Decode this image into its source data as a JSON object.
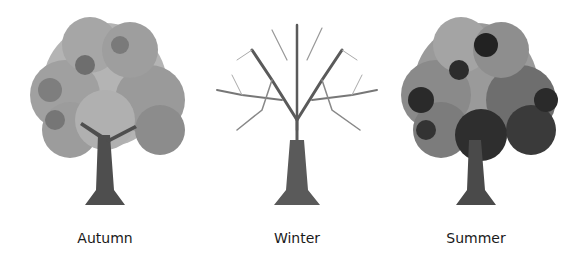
{
  "trees": [
    {
      "season": "Autumn",
      "type": "leafy-light",
      "center_x": 105
    },
    {
      "season": "Winter",
      "type": "bare",
      "center_x": 297
    },
    {
      "season": "Summer",
      "type": "leafy-dark",
      "center_x": 476
    }
  ],
  "colors": {
    "background": "#ffffff",
    "label": "#1a1a1a",
    "trunk": "#4a4a4a",
    "foliage_light": "#b8b8b8",
    "foliage_mid": "#8a8a8a",
    "foliage_dark": "#2e2e2e"
  }
}
